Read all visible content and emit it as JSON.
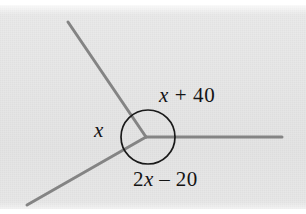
{
  "figure": {
    "kind": "geometry-diagram",
    "width": 306,
    "height": 214,
    "background_color": "#e7e7e7",
    "page_color": "#ffffff"
  },
  "colors": {
    "ray_stroke": "#848484",
    "circle_stroke": "#1a1a1a",
    "label_text": "#141414",
    "plate": "#e7e7e7"
  },
  "vertex": {
    "label": "vertex",
    "x": 146,
    "y": 137
  },
  "circle": {
    "label": "angle-circle",
    "cx": 148,
    "cy": 137,
    "r": 27,
    "stroke_width": 1.7
  },
  "rays": [
    {
      "name": "ray-upper-left",
      "from": {
        "x": 146,
        "y": 137
      },
      "to": {
        "x": 68,
        "y": 22
      },
      "stroke_width": 3
    },
    {
      "name": "ray-lower-left",
      "from": {
        "x": 146,
        "y": 137
      },
      "to": {
        "x": 27,
        "y": 205
      },
      "stroke_width": 3
    },
    {
      "name": "ray-right",
      "from": {
        "x": 146,
        "y": 137
      },
      "to": {
        "x": 282,
        "y": 137
      },
      "stroke_width": 3
    }
  ],
  "labels": {
    "top_right": {
      "name": "angle-label-x-plus-40",
      "text": "x + 40",
      "variable": "x",
      "operator": "+",
      "constant": "40",
      "position": {
        "x": 159,
        "y": 85
      }
    },
    "left": {
      "name": "angle-label-x",
      "text": "x",
      "variable": "x",
      "position": {
        "x": 94,
        "y": 120
      }
    },
    "bottom": {
      "name": "angle-label-2x-minus-20",
      "text": "2x – 20",
      "coefficient": "2",
      "variable": "x",
      "operator": "–",
      "constant": "20",
      "position": {
        "x": 133,
        "y": 169
      }
    }
  }
}
